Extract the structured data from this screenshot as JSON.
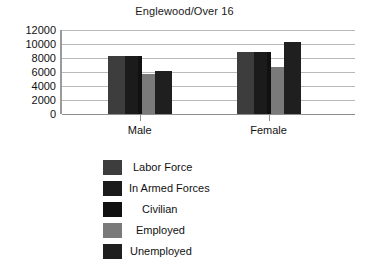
{
  "chart_data": {
    "type": "bar",
    "title": "Englewood/Over 16",
    "xlabel": "",
    "ylabel": "",
    "categories": [
      "Male",
      "Female"
    ],
    "ylim": [
      0,
      12000
    ],
    "yticks": [
      "12000",
      "10000",
      "8000",
      "6000",
      "4000",
      "2000",
      "0"
    ],
    "grid": true,
    "legend_position": "bottom",
    "series": [
      {
        "name": "Labor Force",
        "color": "#3d3d3d",
        "values": [
          8300,
          8800
        ]
      },
      {
        "name": "In Armed Forces",
        "color": "#1b1b1b",
        "values": [
          8300,
          8800
        ]
      },
      {
        "name": "Civilian",
        "color": "#111111",
        "values": [
          8300,
          8800
        ]
      },
      {
        "name": "Employed",
        "color": "#7a7a7a",
        "values": [
          5700,
          6700
        ]
      },
      {
        "name": "Unemployed",
        "color": "#1f1f1f",
        "values": [
          6200,
          10300
        ]
      }
    ]
  },
  "legend": {
    "items": [
      {
        "label": "Labor Force"
      },
      {
        "label": "In Armed Forces"
      },
      {
        "label": "Civilian"
      },
      {
        "label": "Employed"
      },
      {
        "label": "Unemployed"
      }
    ]
  }
}
